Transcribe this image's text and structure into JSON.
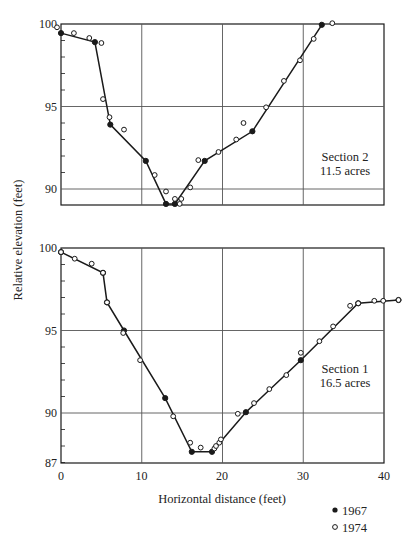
{
  "chart_data": {
    "type": "line",
    "title": "",
    "xlabel": "Horizontal distance (feet)",
    "ylabel": "Relative elevation (feet)",
    "legend": [
      {
        "label": "1967",
        "marker": "filled-circle"
      },
      {
        "label": "1974",
        "marker": "open-circle"
      }
    ],
    "legend_position": "bottom-right",
    "grid": true,
    "x_ticks": [
      0,
      10,
      20,
      30,
      40
    ],
    "xlim": [
      0,
      40
    ],
    "panels": [
      {
        "id": "section-2",
        "annotation": [
          "Section 2",
          "11.5 acres"
        ],
        "ylim": [
          89,
          100
        ],
        "y_ticks": [
          90,
          95,
          100
        ],
        "y_tick_labels": [
          "90",
          "95",
          "100"
        ],
        "series": [
          {
            "name": "1967",
            "line": true,
            "points": [
              [
                0,
                99.45
              ],
              [
                4.2,
                98.9
              ],
              [
                6.1,
                93.9
              ],
              [
                10.5,
                91.7
              ],
              [
                13.0,
                89.1
              ],
              [
                14.1,
                89.1
              ],
              [
                17.8,
                91.7
              ],
              [
                23.7,
                93.5
              ],
              [
                32.3,
                99.95
              ]
            ]
          },
          {
            "name": "1974",
            "line": false,
            "points": [
              [
                -0.5,
                99.8
              ],
              [
                1.6,
                99.45
              ],
              [
                3.5,
                99.15
              ],
              [
                5.0,
                98.85
              ],
              [
                5.2,
                95.45
              ],
              [
                6.0,
                94.35
              ],
              [
                7.8,
                93.6
              ],
              [
                11.6,
                90.85
              ],
              [
                13.0,
                89.85
              ],
              [
                14.1,
                89.4
              ],
              [
                14.9,
                89.4
              ],
              [
                14.7,
                89.1
              ],
              [
                16.0,
                90.1
              ],
              [
                17.0,
                91.75
              ],
              [
                19.5,
                92.24
              ],
              [
                21.7,
                93.0
              ],
              [
                22.6,
                94.0
              ],
              [
                25.4,
                94.95
              ],
              [
                27.6,
                96.55
              ],
              [
                29.6,
                97.8
              ],
              [
                31.3,
                99.1
              ],
              [
                33.6,
                100.05
              ]
            ]
          }
        ]
      },
      {
        "id": "section-1",
        "annotation": [
          "Section 1",
          "16.5 acres"
        ],
        "ylim": [
          87,
          100
        ],
        "y_ticks": [
          87,
          90,
          95,
          100
        ],
        "y_tick_labels": [
          "87",
          "90",
          "95",
          "100"
        ],
        "series": [
          {
            "name": "1967",
            "line": true,
            "points": [
              [
                0,
                99.75
              ],
              [
                5.2,
                98.5
              ],
              [
                5.7,
                96.7
              ],
              [
                7.8,
                95.0
              ],
              [
                12.9,
                90.9
              ],
              [
                16.2,
                87.65
              ],
              [
                18.7,
                87.65
              ],
              [
                22.9,
                90.05
              ],
              [
                29.7,
                93.2
              ],
              [
                36.8,
                96.65
              ],
              [
                41.8,
                96.85
              ]
            ]
          },
          {
            "name": "1974",
            "line": false,
            "points": [
              [
                0,
                99.75
              ],
              [
                1.7,
                99.35
              ],
              [
                3.8,
                99.05
              ],
              [
                5.2,
                98.5
              ],
              [
                5.7,
                96.7
              ],
              [
                7.7,
                94.85
              ],
              [
                9.8,
                93.2
              ],
              [
                13.9,
                89.8
              ],
              [
                16.0,
                88.2
              ],
              [
                17.3,
                87.9
              ],
              [
                19.0,
                87.85
              ],
              [
                19.2,
                88.0
              ],
              [
                19.6,
                88.2
              ],
              [
                19.8,
                88.4
              ],
              [
                21.9,
                89.95
              ],
              [
                23.9,
                90.6
              ],
              [
                25.8,
                91.45
              ],
              [
                27.9,
                92.3
              ],
              [
                29.7,
                93.65
              ],
              [
                32.0,
                94.35
              ],
              [
                33.7,
                95.25
              ],
              [
                35.8,
                96.5
              ],
              [
                36.8,
                96.65
              ],
              [
                38.8,
                96.8
              ],
              [
                39.9,
                96.8
              ],
              [
                41.8,
                96.85
              ]
            ]
          }
        ]
      }
    ]
  },
  "labels": {
    "xlabel": "Horizontal distance (feet)",
    "ylabel": "Relative elevation (feet)",
    "legend_1967": "1967",
    "legend_1974": "1974",
    "section2_line1": "Section 2",
    "section2_line2": "11.5 acres",
    "section1_line1": "Section 1",
    "section1_line2": "16.5 acres",
    "xtick_0": "0",
    "xtick_10": "10",
    "xtick_20": "20",
    "xtick_30": "30",
    "xtick_40": "40"
  },
  "colors": {
    "ink": "#1a1a1a",
    "grid": "#555555",
    "background": "#ffffff"
  }
}
